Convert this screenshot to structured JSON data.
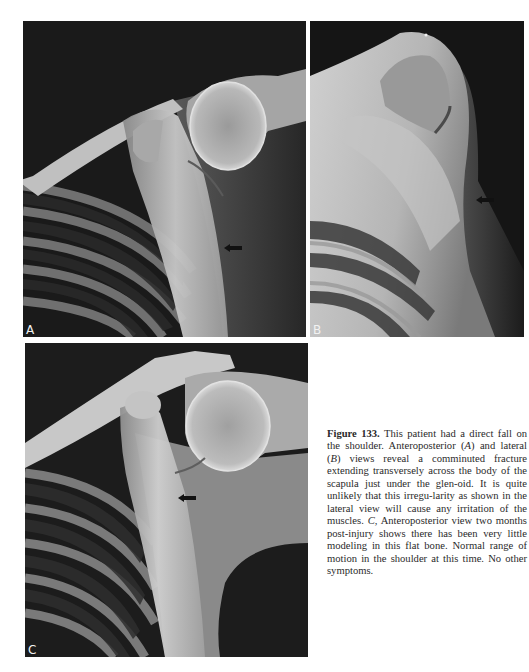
{
  "figure": {
    "panels": [
      {
        "id": "A",
        "letter": "A",
        "view": "Anteroposterior",
        "arrow_direction": "left"
      },
      {
        "id": "B",
        "letter": "B",
        "view": "Lateral",
        "arrow_direction": "left"
      },
      {
        "id": "C",
        "letter": "C",
        "view": "Anteroposterior, two months postinjury",
        "arrow_direction": "left"
      }
    ],
    "caption": {
      "label": "Figure 133.",
      "parts": [
        " This patient had a direct fall on the shoulder. Anteroposterior (",
        "A",
        ") and lateral (",
        "B",
        ") views reveal a comminuted fracture extending transversely across the body of the scapula just under the glen-­oid. It is quite unlikely that this irregu-­larity as shown in the lateral view will cause any irritation of the muscles. ",
        "C",
        ", Anteroposterior view two months post-­injury shows there has been very little modeling in this flat bone. Normal range of motion in the shoulder at this time. No other symptoms."
      ]
    }
  }
}
